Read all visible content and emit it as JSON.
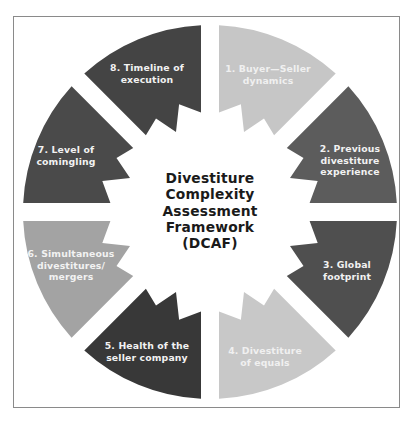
{
  "diagram": {
    "center_title": "Divestiture\nComplexity\nAssessment\nFramework\n(DCAF)",
    "segments": [
      {
        "id": 1,
        "label": "1. Buyer—Seller\ndynamics",
        "color": "#c6c6c6",
        "text_color": "#f0f0f0"
      },
      {
        "id": 2,
        "label": "2. Previous\ndivestiture\nexperience",
        "color": "#5c5c5c",
        "text_color": "#f2f2f2"
      },
      {
        "id": 3,
        "label": "3. Global\nfootprint",
        "color": "#4f4f4f",
        "text_color": "#f2f2f2"
      },
      {
        "id": 4,
        "label": "4. Divestiture\nof equals",
        "color": "#c8c8c8",
        "text_color": "#f0f0f0"
      },
      {
        "id": 5,
        "label": "5. Health of the\nseller company",
        "color": "#383838",
        "text_color": "#f2f2f2"
      },
      {
        "id": 6,
        "label": "6. Simultaneous\ndivestitures/\nmergers",
        "color": "#a3a3a3",
        "text_color": "#f2f2f2"
      },
      {
        "id": 7,
        "label": "7. Level of\ncomingling",
        "color": "#4a4a4a",
        "text_color": "#f2f2f2"
      },
      {
        "id": 8,
        "label": "8. Timeline of\nexecution",
        "color": "#444444",
        "text_color": "#f2f2f2"
      }
    ],
    "colors": {
      "frame_border": "#8a8a8a",
      "background": "#ffffff",
      "center_text": "#1a1a1a"
    }
  }
}
